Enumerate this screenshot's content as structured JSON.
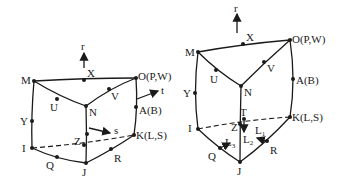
{
  "left_element": {
    "title": "hexahedral element with local axes r, s, t",
    "axes": {
      "r": "r",
      "s": "s",
      "t": "t"
    },
    "nodes": {
      "M": "M",
      "X": "X",
      "O": "O(P,W)",
      "U": "U",
      "N": "N",
      "V": "V",
      "Y": "Y",
      "A": "A(B)",
      "I": "I",
      "Q": "Q",
      "J": "J",
      "R": "R",
      "K": "K(L,S)",
      "Z": "Z"
    }
  },
  "right_element": {
    "title": "wedge element with area coordinates L1, L2, L3",
    "axes": {
      "r": "r",
      "L1": "L",
      "L1_sub": "1",
      "L2": "L",
      "L2_sub": "2",
      "L3": "L",
      "L3_sub": "3"
    },
    "nodes": {
      "M": "M",
      "X": "X",
      "O": "O(P,W)",
      "U": "U",
      "N": "N",
      "V": "V",
      "Y": "Y",
      "A": "A(B)",
      "I": "I",
      "Q": "Q",
      "J": "J",
      "R": "R",
      "K": "K(L,S)",
      "T": "T",
      "Z": "Z"
    }
  },
  "colors": {
    "ink": "#1a1a1a",
    "background": "#ffffff"
  }
}
